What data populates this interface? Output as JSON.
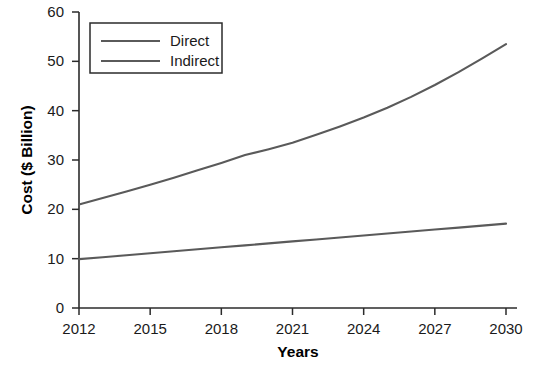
{
  "chart_data": {
    "type": "line",
    "title": "",
    "xlabel": "Years",
    "ylabel": "Cost ($ Billion)",
    "x": [
      2012,
      2013,
      2014,
      2015,
      2016,
      2017,
      2018,
      2019,
      2020,
      2021,
      2022,
      2023,
      2024,
      2025,
      2026,
      2027,
      2028,
      2029,
      2030
    ],
    "xlim": [
      2012,
      2030
    ],
    "ylim": [
      0,
      60
    ],
    "xticks": [
      "2012",
      "2015",
      "2018",
      "2021",
      "2024",
      "2027",
      "2030"
    ],
    "xtick_values": [
      2012,
      2015,
      2018,
      2021,
      2024,
      2027,
      2030
    ],
    "yticks": [
      "0",
      "10",
      "20",
      "30",
      "40",
      "50",
      "60"
    ],
    "ytick_values": [
      0,
      10,
      20,
      30,
      40,
      50,
      60
    ],
    "grid": false,
    "legend_position": "top-left",
    "series": [
      {
        "name": "Direct",
        "color": "#5a5a5a",
        "values": [
          21.0,
          22.3,
          23.6,
          25.0,
          26.4,
          27.9,
          29.4,
          31.0,
          32.2,
          33.5,
          35.1,
          36.8,
          38.6,
          40.6,
          42.8,
          45.2,
          47.8,
          50.6,
          53.5
        ]
      },
      {
        "name": "Indirect",
        "color": "#5a5a5a",
        "values": [
          9.9,
          10.3,
          10.7,
          11.1,
          11.5,
          11.9,
          12.3,
          12.7,
          13.1,
          13.5,
          13.9,
          14.3,
          14.7,
          15.1,
          15.5,
          15.9,
          16.3,
          16.7,
          17.1
        ]
      }
    ]
  },
  "legend": {
    "entries": [
      {
        "label": "Direct"
      },
      {
        "label": "Indirect"
      }
    ]
  },
  "axes": {
    "y_title": "Cost ($ Billion)",
    "x_title": "Years"
  }
}
